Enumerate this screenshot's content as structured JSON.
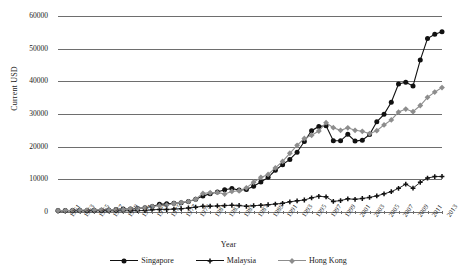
{
  "chart_data": {
    "type": "line",
    "title": "",
    "xlabel": "Year",
    "ylabel": "Current USD",
    "ylim": [
      0,
      60000
    ],
    "ytick_values": [
      0,
      10000,
      20000,
      30000,
      40000,
      50000,
      60000
    ],
    "ytick_labels": [
      "0",
      "10000",
      "20000",
      "30000",
      "40000",
      "50000",
      "60000"
    ],
    "grid": true,
    "legend_position": "bottom-center",
    "xlim": [
      1960,
      2013
    ],
    "x": [
      1960,
      1961,
      1962,
      1963,
      1964,
      1965,
      1966,
      1967,
      1968,
      1969,
      1970,
      1971,
      1972,
      1973,
      1974,
      1975,
      1976,
      1977,
      1978,
      1979,
      1980,
      1981,
      1982,
      1983,
      1984,
      1985,
      1986,
      1987,
      1988,
      1989,
      1990,
      1991,
      1992,
      1993,
      1994,
      1995,
      1996,
      1997,
      1998,
      1999,
      2000,
      2001,
      2002,
      2003,
      2004,
      2005,
      2006,
      2007,
      2008,
      2009,
      2010,
      2011,
      2012,
      2013
    ],
    "xtick_labels": [
      "1961",
      "1963",
      "1965",
      "1967",
      "1969",
      "1971",
      "1973",
      "1975",
      "1977",
      "1979",
      "1981",
      "1983",
      "1985",
      "1987",
      "1989",
      "1991",
      "1993",
      "1995",
      "1997",
      "1999",
      "2001",
      "2003",
      "2005",
      "2007",
      "2009",
      "2011",
      "2013"
    ],
    "series": [
      {
        "name": "Singapore",
        "color": "#111111",
        "marker": "circle",
        "values": [
          430,
          450,
          470,
          510,
          480,
          520,
          570,
          650,
          760,
          900,
          920,
          1100,
          1300,
          1700,
          2340,
          2500,
          2700,
          2850,
          3200,
          3900,
          4860,
          5600,
          6100,
          6800,
          7200,
          6700,
          6900,
          7900,
          9200,
          10600,
          12770,
          14500,
          16100,
          18300,
          21600,
          24900,
          26200,
          26400,
          21800,
          21800,
          23800,
          21700,
          22000,
          23700,
          27600,
          29900,
          33600,
          39200,
          39700,
          38600,
          46500,
          53100,
          54400,
          55200
        ]
      },
      {
        "name": "Malaysia",
        "color": "#111111",
        "marker": "plus",
        "values": [
          300,
          300,
          310,
          320,
          310,
          330,
          340,
          330,
          330,
          350,
          390,
          400,
          470,
          660,
          800,
          770,
          890,
          1030,
          1230,
          1470,
          1770,
          1770,
          1860,
          1980,
          2060,
          2000,
          1730,
          1950,
          2050,
          2240,
          2440,
          2660,
          3120,
          3420,
          3680,
          4330,
          4800,
          4640,
          3250,
          3490,
          4040,
          3870,
          4140,
          4460,
          4930,
          5560,
          6230,
          7240,
          8530,
          7300,
          9070,
          10400,
          10830,
          10880
        ]
      },
      {
        "name": "Hong Kong",
        "color": "#8d8d8d",
        "marker": "diamond",
        "values": [
          430,
          440,
          490,
          550,
          590,
          650,
          660,
          670,
          720,
          800,
          960,
          1070,
          1300,
          1700,
          1950,
          2130,
          2600,
          2900,
          3200,
          3900,
          5700,
          5900,
          6000,
          5500,
          6300,
          6500,
          7400,
          9100,
          10600,
          11500,
          13490,
          15470,
          17980,
          20400,
          22500,
          23500,
          24800,
          27330,
          25800,
          25000,
          25760,
          25000,
          24700,
          23980,
          24900,
          26650,
          28200,
          30590,
          31500,
          30700,
          32600,
          35100,
          36700,
          38100
        ]
      }
    ]
  },
  "axes": {
    "y_title": "Current USD",
    "x_title": "Year"
  },
  "legend": {
    "items": [
      {
        "label": "Singapore"
      },
      {
        "label": "Malaysia"
      },
      {
        "label": "Hong Kong"
      }
    ]
  }
}
